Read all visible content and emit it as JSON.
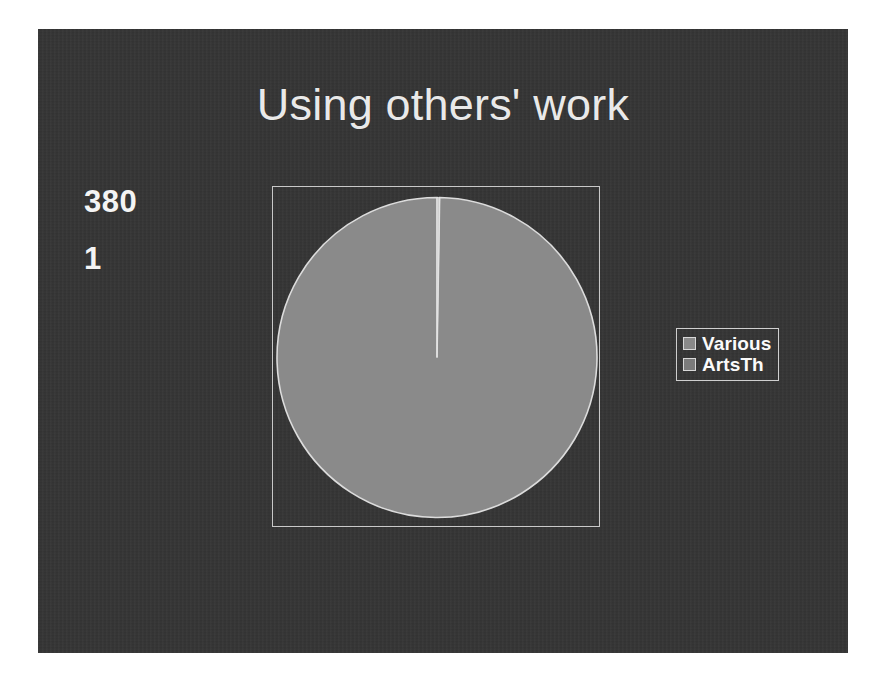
{
  "slide": {
    "title": "Using others' work",
    "background_color": "#353535",
    "title_color": "#e9e9e9"
  },
  "values": [
    {
      "text": "380"
    },
    {
      "text": "1"
    }
  ],
  "legend": {
    "entries": [
      {
        "label": "Various",
        "color": "#8a8a8a"
      },
      {
        "label": "ArtsTh",
        "color": "#7b7b7b"
      }
    ]
  },
  "chart_data": {
    "type": "pie",
    "title": "Using others' work",
    "categories": [
      "Various",
      "ArtsTh"
    ],
    "values": [
      380,
      1
    ],
    "labels_shown": [
      "380",
      "1"
    ],
    "colors": [
      "#8a8a8a",
      "#cfcfcf"
    ],
    "start_angle_deg": 90,
    "direction": "counterclockwise",
    "percentages": [
      99.74,
      0.26
    ],
    "legend_position": "right",
    "grid": false,
    "plot_border": true,
    "plot_border_color": "#c9c9c9"
  }
}
